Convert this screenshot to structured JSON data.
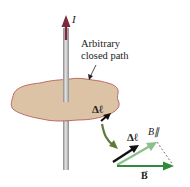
{
  "diagram": {
    "current_label": "I",
    "path_label_line1": "Arbitrary",
    "path_label_line2": "closed path",
    "dl_on_path_label": "Δℓ",
    "dl_vector_label": "Δℓ",
    "b_parallel_label": "B∥",
    "b_vector_label": "B",
    "colors": {
      "wire": "#a8a8a8",
      "current_arrow": "#7a2a3a",
      "surface_fill": "#dcc3a5",
      "surface_edge": "#b0504a",
      "dl_arrow": "#111111",
      "b_arrow": "#2f8a3c",
      "b_parallel_arrow": "#8cc08a",
      "transition_arrow": "#5f7a3a"
    }
  }
}
